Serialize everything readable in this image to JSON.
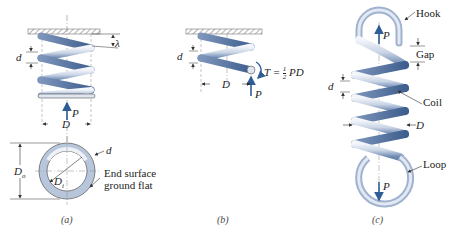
{
  "figure": {
    "panels": [
      {
        "id": "a",
        "caption": "(a)",
        "labels": {
          "pitch": "λ",
          "wire_diameter": "d",
          "load": "P",
          "mean_diameter": "D",
          "outer_diameter": "D",
          "outer_diameter_sub": "o",
          "inner_diameter": "D",
          "inner_diameter_sub": "i",
          "ring_wire": "d",
          "end_note_line1": "End surface",
          "end_note_line2": "ground flat"
        }
      },
      {
        "id": "b",
        "caption": "(b)",
        "labels": {
          "wire_diameter": "d",
          "mean_diameter": "D",
          "load": "P",
          "torque": "T = ",
          "torque_num": "1",
          "torque_den": "2",
          "torque_tail": " PD"
        }
      },
      {
        "id": "c",
        "caption": "(c)",
        "labels": {
          "hook": "Hook",
          "gap": "Gap",
          "load_top": "P",
          "wire_diameter": "d",
          "coil": "Coil",
          "mean_diameter": "D",
          "loop": "Loop",
          "load_bottom": "P"
        }
      }
    ],
    "colors": {
      "spring_light": "#dfe6f0",
      "spring_dark": "#5f7ba6",
      "arrow": "#2f5d95",
      "line": "#333333",
      "ground": "#9a9a9a"
    }
  }
}
